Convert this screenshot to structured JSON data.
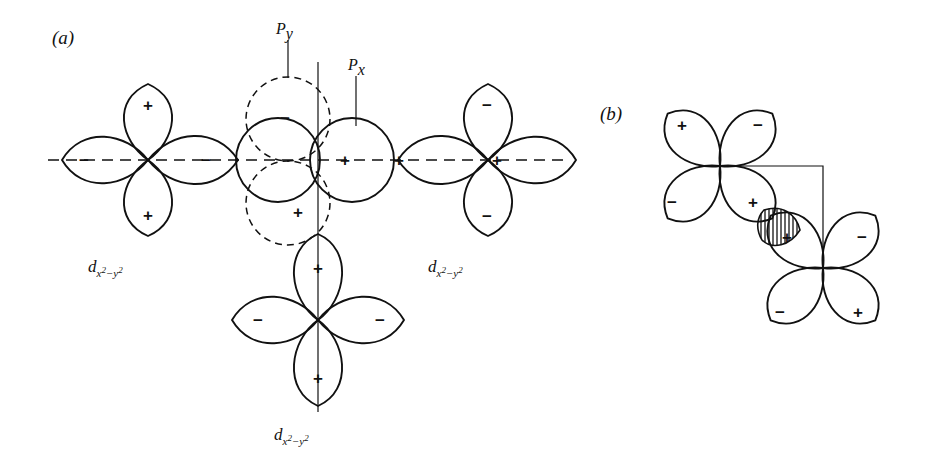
{
  "figure": {
    "background_color": "#ffffff",
    "ink_color": "#111111",
    "width": 929,
    "height": 475
  },
  "panels": [
    {
      "id": "a",
      "label": "(a)",
      "description": "Three d(x2-y2) orbitals arranged around a central atom with px and py orbitals"
    },
    {
      "id": "b",
      "label": "(b)",
      "description": "Two diagonally oriented d(x2-y2) orbitals with a hatched overlap lens"
    }
  ],
  "orbital_labels": {
    "d_base": "d",
    "d_sub_first": "x",
    "d_sup_first": "2",
    "d_minus": "−",
    "d_sub_second": "y",
    "d_sup_second": "2",
    "p_y": "P",
    "p_y_sub": "y",
    "p_x": "P",
    "p_x_sub": "x"
  },
  "d_orbital_instances": [
    {
      "name": "left-d-orbital",
      "label_text": "d x2-y2",
      "center_x": 148,
      "center_y": 160
    },
    {
      "name": "right-d-orbital",
      "label_text": "d x2-y2",
      "center_x": 488,
      "center_y": 160
    },
    {
      "name": "bottom-d-orbital",
      "label_text": "d x2-y2",
      "center_x": 318,
      "center_y": 320
    }
  ],
  "signs": {
    "plus": "+",
    "minus": "−"
  },
  "panel_a_signs": [
    {
      "name": "left-d-top-lobe-sign",
      "value": "+",
      "x": 148,
      "y": 105
    },
    {
      "name": "left-d-bottom-lobe-sign",
      "value": "+",
      "x": 148,
      "y": 215
    },
    {
      "name": "left-d-outer-lobe-sign",
      "value": "−",
      "x": 84,
      "y": 160
    },
    {
      "name": "left-d-inner-lobe-sign",
      "value": "−",
      "x": 206,
      "y": 160
    },
    {
      "name": "py-upper-lobe-sign",
      "value": "−",
      "x": 285,
      "y": 118
    },
    {
      "name": "py-lower-lobe-sign",
      "value": "+",
      "x": 298,
      "y": 212
    },
    {
      "name": "px-right-lobe-sign",
      "value": "+",
      "x": 345,
      "y": 160
    },
    {
      "name": "center-right-lobe-sign",
      "value": "+",
      "x": 399,
      "y": 160
    },
    {
      "name": "right-d-outer-lobe-sign",
      "value": "+",
      "x": 497,
      "y": 160
    },
    {
      "name": "right-d-top-lobe-sign",
      "value": "−",
      "x": 487,
      "y": 105
    },
    {
      "name": "right-d-bottom-lobe-sign",
      "value": "−",
      "x": 487,
      "y": 216
    },
    {
      "name": "bottom-d-top-lobe-sign",
      "value": "+",
      "x": 318,
      "y": 268
    },
    {
      "name": "bottom-d-left-lobe-sign",
      "value": "−",
      "x": 258,
      "y": 320
    },
    {
      "name": "bottom-d-right-lobe-sign",
      "value": "−",
      "x": 380,
      "y": 320
    },
    {
      "name": "bottom-d-bottom-lobe-sign",
      "value": "+",
      "x": 318,
      "y": 378
    }
  ],
  "panel_b_signs": [
    {
      "name": "upper-d-upper-left-lobe-sign",
      "value": "+",
      "x": 682,
      "y": 125
    },
    {
      "name": "upper-d-upper-right-lobe-sign",
      "value": "−",
      "x": 758,
      "y": 125
    },
    {
      "name": "upper-d-lower-left-lobe-sign",
      "value": "−",
      "x": 672,
      "y": 202
    },
    {
      "name": "upper-d-lower-right-lobe-sign",
      "value": "+",
      "x": 753,
      "y": 202
    },
    {
      "name": "lower-d-upper-left-lobe-sign",
      "value": "+",
      "x": 787,
      "y": 237
    },
    {
      "name": "lower-d-upper-right-lobe-sign",
      "value": "−",
      "x": 862,
      "y": 237
    },
    {
      "name": "lower-d-lower-left-lobe-sign",
      "value": "−",
      "x": 780,
      "y": 312
    },
    {
      "name": "lower-d-lower-right-lobe-sign",
      "value": "+",
      "x": 858,
      "y": 312
    }
  ],
  "overlap_region": {
    "name": "hatched-overlap-lens",
    "hatch_pattern": "vertical-lines",
    "hatch_spacing_px": 4
  }
}
